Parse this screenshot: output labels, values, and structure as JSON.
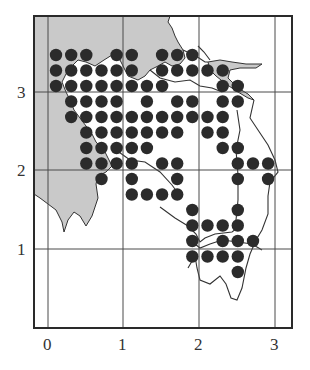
{
  "figure": {
    "type": "distribution-map",
    "colors": {
      "frame": "#2a2a2a",
      "grid": "#444444",
      "land_shaded": "#c8c8c8",
      "dot": "#2b2b2b",
      "coast": "#333333"
    }
  },
  "axes": {
    "x_ticks": [
      {
        "label": "0",
        "value": 0
      },
      {
        "label": "1",
        "value": 1
      },
      {
        "label": "2",
        "value": 2
      },
      {
        "label": "3",
        "value": 3
      }
    ],
    "y_ticks": [
      {
        "label": "1",
        "value": 1
      },
      {
        "label": "2",
        "value": 2
      },
      {
        "label": "3",
        "value": 3
      }
    ]
  },
  "grid_geometry": {
    "col_origin_x": 56,
    "col_step": 15.15,
    "row_origin_y": 55,
    "row_step": 15.5,
    "dot_radius": 6.2
  },
  "dots": {
    "rows": [
      {
        "row": 0,
        "cols": [
          0,
          1,
          2,
          4,
          5,
          7,
          8,
          9
        ]
      },
      {
        "row": 1,
        "cols": [
          0,
          1,
          2,
          3,
          4,
          5,
          7,
          8,
          9,
          10,
          11
        ]
      },
      {
        "row": 2,
        "cols": [
          0,
          1,
          2,
          3,
          4,
          5,
          6,
          7,
          11,
          12
        ]
      },
      {
        "row": 3,
        "cols": [
          1,
          2,
          3,
          4,
          6,
          8,
          9,
          11,
          12
        ]
      },
      {
        "row": 4,
        "cols": [
          1,
          2,
          3,
          4,
          5,
          6,
          7,
          8,
          9,
          10,
          11
        ]
      },
      {
        "row": 5,
        "cols": [
          2,
          3,
          4,
          5,
          6,
          7,
          8,
          10,
          11
        ]
      },
      {
        "row": 6,
        "cols": [
          2,
          3,
          4,
          5,
          6,
          11,
          12
        ]
      },
      {
        "row": 7,
        "cols": [
          2,
          3,
          4,
          5,
          7,
          8,
          12,
          13,
          14
        ]
      },
      {
        "row": 8,
        "cols": [
          3,
          5,
          8,
          12,
          14
        ]
      },
      {
        "row": 9,
        "cols": [
          5,
          6,
          7,
          8
        ]
      },
      {
        "row": 10,
        "cols": [
          9,
          12
        ]
      },
      {
        "row": 11,
        "cols": [
          9,
          10,
          11,
          12
        ]
      },
      {
        "row": 12,
        "cols": [
          9,
          11,
          12,
          13
        ]
      },
      {
        "row": 13,
        "cols": [
          9,
          10,
          11,
          12
        ]
      },
      {
        "row": 14,
        "cols": [
          12
        ]
      }
    ]
  }
}
